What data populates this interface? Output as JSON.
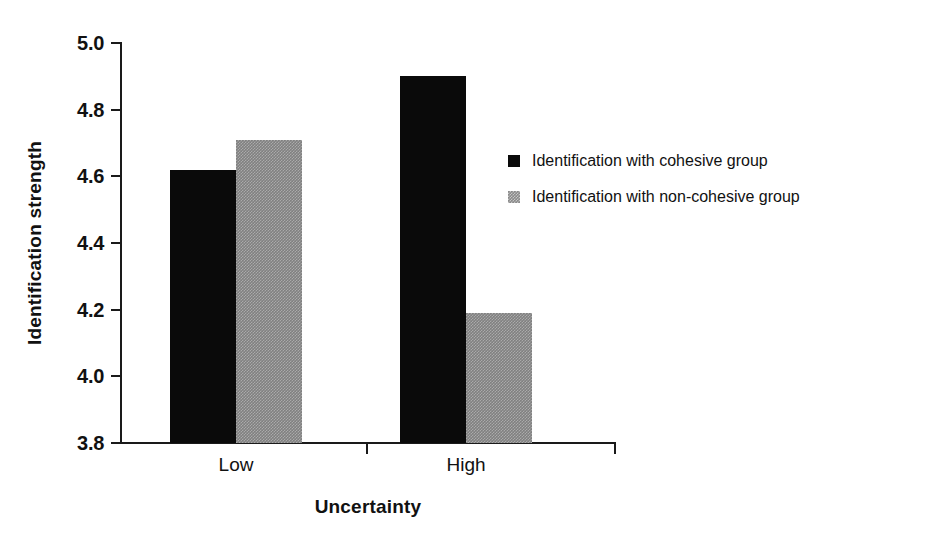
{
  "chart_data": {
    "type": "bar",
    "title": "",
    "xlabel": "Uncertainty",
    "ylabel": "Identification strength",
    "categories": [
      "Low",
      "High"
    ],
    "ylim": [
      3.8,
      5.0
    ],
    "ytick_values": [
      5.0,
      4.8,
      4.6,
      4.4,
      4.2,
      4.0,
      3.8
    ],
    "ytick_labels": [
      "5.0",
      "4.8",
      "4.6",
      "4.4",
      "4.2",
      "4.0",
      "3.8"
    ],
    "grid": false,
    "legend_position": "inside-right",
    "series": [
      {
        "name": "Identification with cohesive group",
        "color": "#0a0a0a",
        "fill": "solid-black",
        "values": [
          4.62,
          4.9
        ]
      },
      {
        "name": "Identification with non-cohesive group",
        "color": "#808080",
        "fill": "dithered-gray",
        "values": [
          4.71,
          4.19
        ]
      }
    ]
  },
  "axes": {
    "y_title": "Identification strength",
    "x_title": "Uncertainty"
  },
  "legend": {
    "entries": [
      {
        "label": "Identification with cohesive group",
        "swatch": "black-square-swatch"
      },
      {
        "label": "Identification with non-cohesive group",
        "swatch": "gray-square-swatch"
      }
    ]
  }
}
